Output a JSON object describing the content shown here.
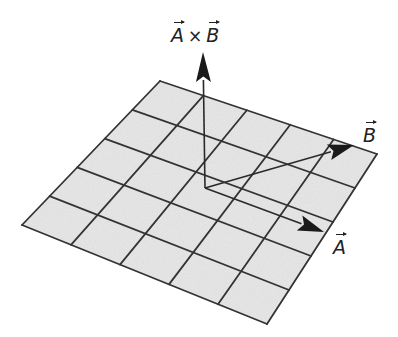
{
  "diagram": {
    "type": "vector-cross-product",
    "plane": {
      "grid_rows": 5,
      "grid_cols": 5,
      "corners": {
        "back": [
          160,
          81
        ],
        "right": [
          377,
          154
        ],
        "front": [
          267,
          324
        ],
        "left": [
          22,
          225
        ]
      },
      "fill_color": "#e6e6e6",
      "line_color": "#333333"
    },
    "origin": [
      205,
      188
    ],
    "vectors": [
      {
        "name": "A",
        "tip": [
          324,
          232
        ],
        "label": "A"
      },
      {
        "name": "B",
        "tip": [
          354,
          145
        ],
        "label": "B"
      },
      {
        "name": "AxB",
        "tip": [
          203,
          52
        ],
        "label": "A × B"
      }
    ],
    "labels": {
      "cross_left": "A",
      "cross_op": "×",
      "cross_right": "B",
      "vector_a": "A",
      "vector_b": "B"
    }
  }
}
